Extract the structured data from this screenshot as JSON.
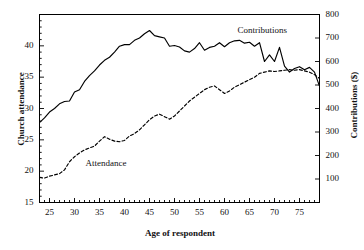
{
  "chart_data": {
    "type": "line",
    "title": "",
    "xlabel": "Age of respondent",
    "ylabel": "Church attendance",
    "y2label": "Contributions ($)",
    "xlim": [
      23,
      79
    ],
    "ylim": [
      15,
      45
    ],
    "y2lim": [
      0,
      800
    ],
    "grid": false,
    "legend_position": "inline-annotations",
    "xticks": [
      25,
      30,
      35,
      40,
      45,
      50,
      55,
      60,
      65,
      70,
      75
    ],
    "xticklabels": [
      "25",
      "30",
      "35",
      "40",
      "45",
      "50",
      "55",
      "60",
      "65",
      "70",
      "75"
    ],
    "x_minor_tick_step": 1,
    "yticks": [
      15,
      20,
      25,
      30,
      35,
      40
    ],
    "yticklabels": [
      "15",
      "20",
      "25",
      "30",
      "35",
      "40"
    ],
    "y2ticks": [
      100,
      200,
      300,
      400,
      500,
      600,
      700,
      800
    ],
    "y2ticklabels": [
      "100",
      "200",
      "300",
      "400",
      "500",
      "600",
      "700",
      "800"
    ],
    "x": [
      23,
      24,
      25,
      26,
      27,
      28,
      29,
      30,
      31,
      32,
      33,
      34,
      35,
      36,
      37,
      38,
      39,
      40,
      41,
      42,
      43,
      44,
      45,
      46,
      47,
      48,
      49,
      50,
      51,
      52,
      53,
      54,
      55,
      56,
      57,
      58,
      59,
      60,
      61,
      62,
      63,
      64,
      65,
      66,
      67,
      68,
      69,
      70,
      71,
      72,
      73,
      74,
      75,
      76,
      77,
      78,
      79
    ],
    "series": [
      {
        "name": "Contributions",
        "axis": "right",
        "style": "solid",
        "units": "$",
        "values": [
          340,
          360,
          385,
          400,
          420,
          430,
          432,
          470,
          480,
          515,
          540,
          560,
          585,
          605,
          618,
          640,
          665,
          672,
          672,
          690,
          700,
          718,
          732,
          710,
          705,
          700,
          665,
          668,
          662,
          645,
          640,
          655,
          680,
          648,
          660,
          665,
          680,
          663,
          680,
          688,
          690,
          678,
          682,
          665,
          680,
          600,
          628,
          600,
          660,
          580,
          555,
          570,
          578,
          565,
          575,
          555,
          495
        ]
      },
      {
        "name": "Attendance",
        "axis": "left",
        "style": "dashed",
        "units": "",
        "values": [
          19.0,
          18.9,
          19.2,
          19.4,
          19.6,
          20.2,
          21.5,
          22.3,
          22.9,
          23.4,
          23.7,
          24.0,
          24.8,
          25.5,
          25.1,
          24.8,
          24.7,
          24.9,
          25.6,
          26.0,
          26.6,
          27.4,
          28.2,
          28.8,
          29.1,
          28.7,
          28.3,
          28.8,
          29.6,
          30.4,
          31.2,
          31.8,
          32.4,
          33.0,
          33.4,
          33.6,
          33.0,
          32.4,
          32.8,
          33.4,
          33.8,
          34.2,
          34.6,
          35.0,
          35.6,
          35.8,
          36.0,
          35.9,
          36.0,
          36.1,
          36.2,
          36.1,
          36.2,
          36.0,
          35.8,
          35.4,
          34.8
        ]
      }
    ],
    "annotations": [
      {
        "text": "Contributions",
        "x": 64,
        "y_right": 730
      },
      {
        "text": "Attendance",
        "x": 32,
        "y_left": 21.2
      }
    ],
    "colors": {
      "line": "#000000",
      "axis": "#000000",
      "background": "#ffffff"
    }
  },
  "axes": {
    "left_title": "Church attendance",
    "right_title": "Contributions ($)",
    "bottom_title": "Age of respondent"
  },
  "labels": {
    "contributions": "Contributions",
    "attendance": "Attendance"
  }
}
